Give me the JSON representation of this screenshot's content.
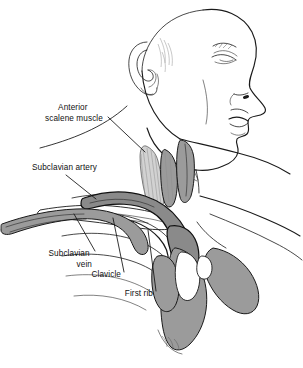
{
  "figure": {
    "view": "right lateral profile of head, neck and shoulder",
    "background_color": "#ffffff",
    "line_color": "#1a1a1a",
    "shade_colors": {
      "muscle_mid": "#9b9b9b",
      "vessel_dark": "#8a8a8a",
      "bone_light": "#d2d2d2",
      "highlight": "#ffffff"
    }
  },
  "labels": [
    {
      "id": "anterior-scalene-muscle",
      "lines": [
        "Anterior",
        "scalene muscle"
      ],
      "align": "center",
      "text_x": 74,
      "text_y": 110,
      "line_height": 11,
      "leader": {
        "x1": 108,
        "y1": 117,
        "x2": 145,
        "y2": 152
      }
    },
    {
      "id": "subclavian-artery",
      "lines": [
        "Subclavian artery"
      ],
      "align": "left",
      "text_x": 32,
      "text_y": 170,
      "line_height": 11,
      "leader": {
        "x1": 66,
        "y1": 175,
        "x2": 96,
        "y2": 199
      }
    },
    {
      "id": "subclavian-vein",
      "lines": [
        "Subclavian",
        "vein"
      ],
      "align": "right",
      "text_x": 92,
      "text_y": 256,
      "line_height": 11,
      "leader": {
        "x1": 95,
        "y1": 251,
        "x2": 74,
        "y2": 214
      }
    },
    {
      "id": "clavicle",
      "lines": [
        "Clavicle"
      ],
      "align": "right",
      "text_x": 121,
      "text_y": 277,
      "line_height": 11,
      "leader": {
        "x1": 124,
        "y1": 272,
        "x2": 113,
        "y2": 218
      }
    },
    {
      "id": "first-rib",
      "lines": [
        "First rib"
      ],
      "align": "right",
      "text_x": 153,
      "text_y": 296,
      "line_height": 11,
      "leader": {
        "x1": 156,
        "y1": 291,
        "x2": 148,
        "y2": 230
      }
    }
  ],
  "structures": [
    {
      "id": "head-profile",
      "name": "head and face profile"
    },
    {
      "id": "ear",
      "name": "external ear"
    },
    {
      "id": "neck",
      "name": "neck contour"
    },
    {
      "id": "shoulder",
      "name": "shoulder and trapezius"
    },
    {
      "id": "scalene-muscle",
      "name": "anterior scalene muscle"
    },
    {
      "id": "subclavian-artery-vessel",
      "name": "subclavian artery"
    },
    {
      "id": "subclavian-vein-vessel",
      "name": "subclavian vein"
    },
    {
      "id": "clavicle-bone",
      "name": "clavicle"
    },
    {
      "id": "first-rib-bone",
      "name": "first rib"
    },
    {
      "id": "ribcage",
      "name": "rib cage"
    },
    {
      "id": "pectoral-mass",
      "name": "pectoral muscle shading"
    },
    {
      "id": "deltoid-mass",
      "name": "deltoid muscle shading"
    }
  ]
}
